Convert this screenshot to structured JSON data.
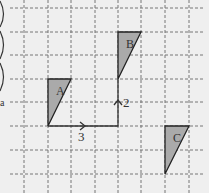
{
  "diagram": {
    "type": "grid-translation",
    "grid": {
      "x_lines": [
        24,
        48,
        71,
        95,
        118,
        141,
        165,
        189
      ],
      "y_lines": [
        8,
        32,
        55,
        79,
        102,
        126,
        150,
        174
      ],
      "line_color": "#777777"
    },
    "shapes": [
      {
        "label": "A",
        "points": "48,79 71,79 48,126",
        "label_pos": [
          56,
          95
        ],
        "fill": "#aaaaaa"
      },
      {
        "label": "B",
        "points": "118,32 141,32 118,79",
        "label_pos": [
          126,
          48
        ],
        "fill": "#aaaaaa"
      },
      {
        "label": "C",
        "points": "165,126 189,126 165,174",
        "label_pos": [
          173,
          142
        ],
        "fill": "#aaaaaa"
      }
    ],
    "translation": {
      "horizontal_label": "3",
      "vertical_label": "2"
    },
    "margin_mark": "a"
  }
}
